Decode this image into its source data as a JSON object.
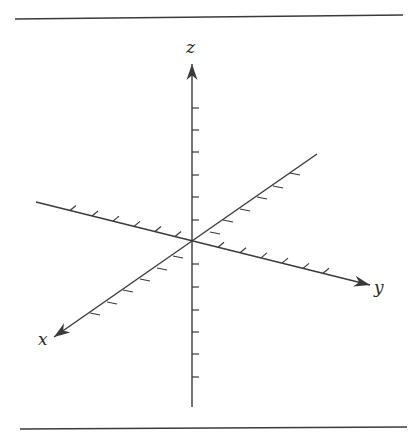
{
  "diagram": {
    "type": "3d-coordinate-axes",
    "colors": {
      "line": "#3a3a3a",
      "background": "#ffffff"
    },
    "rules": {
      "top": {
        "x1": 15,
        "y1": 19,
        "x2": 403,
        "y2": 15
      },
      "bottom": {
        "x1": 20,
        "y1": 429,
        "x2": 407,
        "y2": 427
      }
    },
    "origin": {
      "x": 192,
      "y": 241
    },
    "axes": [
      {
        "name": "z",
        "label": "z",
        "label_pos": {
          "x": 186,
          "y": 53
        },
        "start": {
          "x": 192,
          "y": 407
        },
        "end": {
          "x": 192,
          "y": 64
        },
        "arrow_dir": {
          "x": 0,
          "y": -1
        },
        "ticks": [
          108,
          130,
          152,
          175,
          197,
          220,
          264,
          287,
          310,
          332,
          354,
          377
        ],
        "tick_vec": {
          "x": 7,
          "y": 0
        }
      },
      {
        "name": "y",
        "label": "y",
        "label_pos": {
          "x": 374,
          "y": 293
        },
        "start": {
          "x": 36,
          "y": 202
        },
        "end": {
          "x": 370,
          "y": 285
        },
        "arrow_dir": {
          "x": 0.97,
          "y": 0.24
        },
        "ticks": [
          70,
          92,
          113,
          134,
          155,
          175,
          218,
          240,
          261,
          282,
          303,
          323
        ],
        "tick_vec": {
          "x": 6,
          "y": -5
        }
      },
      {
        "name": "x",
        "label": "x",
        "label_pos": {
          "x": 38,
          "y": 345
        },
        "start": {
          "x": 317,
          "y": 154
        },
        "end": {
          "x": 54,
          "y": 337
        },
        "arrow_dir": {
          "x": -0.82,
          "y": 0.57
        },
        "ticks": [
          [
            290,
            173
          ],
          [
            273,
            186
          ],
          [
            257,
            197
          ],
          [
            240,
            209
          ],
          [
            223,
            220
          ],
          [
            210,
            232
          ],
          [
            173,
            256
          ],
          [
            157,
            268
          ],
          [
            140,
            279
          ],
          [
            123,
            290
          ],
          [
            107,
            302
          ],
          [
            90,
            313
          ]
        ],
        "tick_vec": {
          "x": 10,
          "y": 2
        }
      }
    ]
  }
}
